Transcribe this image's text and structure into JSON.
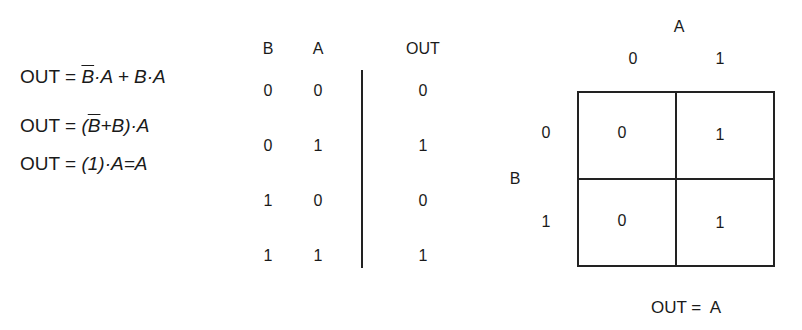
{
  "equations": [
    {
      "lhs": "OUT = ",
      "parts": [
        {
          "t": "B",
          "over": true
        },
        {
          "t": "·A + "
        },
        {
          "t": "B·A"
        }
      ]
    },
    {
      "lhs": "OUT = ",
      "parts": [
        {
          "t": "("
        },
        {
          "t": "B",
          "over": true
        },
        {
          "t": "+B)·A"
        }
      ]
    },
    {
      "lhs": "OUT = ",
      "parts": [
        {
          "t": "(1)·A=A"
        }
      ]
    }
  ],
  "truth_table": {
    "headers": [
      "B",
      "A",
      "OUT"
    ],
    "rows": [
      [
        "0",
        "0",
        "0"
      ],
      [
        "0",
        "1",
        "1"
      ],
      [
        "1",
        "0",
        "0"
      ],
      [
        "1",
        "1",
        "1"
      ]
    ]
  },
  "kmap": {
    "col_var": "A",
    "col_labels": [
      "0",
      "1"
    ],
    "row_var": "B",
    "row_labels": [
      "0",
      "1"
    ],
    "cells": [
      [
        "0",
        "1"
      ],
      [
        "0",
        "1"
      ]
    ],
    "result": "OUT =  A"
  }
}
